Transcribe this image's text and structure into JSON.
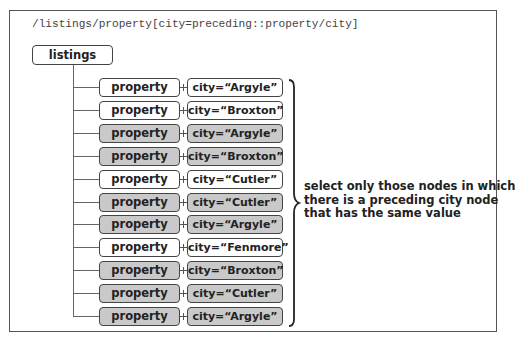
{
  "expression": "/listings/property[city=preceding::property/city]",
  "root": {
    "label": "listings"
  },
  "rows": [
    {
      "element": "property",
      "attribute": "city=“Argyle”",
      "selected": false
    },
    {
      "element": "property",
      "attribute": "city=“Broxton”",
      "selected": false
    },
    {
      "element": "property",
      "attribute": "city=“Argyle”",
      "selected": true
    },
    {
      "element": "property",
      "attribute": "city=“Broxton”",
      "selected": true
    },
    {
      "element": "property",
      "attribute": "city=“Cutler”",
      "selected": false
    },
    {
      "element": "property",
      "attribute": "city=“Cutler”",
      "selected": true
    },
    {
      "element": "property",
      "attribute": "city=“Argyle”",
      "selected": true
    },
    {
      "element": "property",
      "attribute": "city=“Fenmore”",
      "selected": false
    },
    {
      "element": "property",
      "attribute": "city=“Broxton”",
      "selected": true
    },
    {
      "element": "property",
      "attribute": "city=“Cutler”",
      "selected": true
    },
    {
      "element": "property",
      "attribute": "city=“Argyle”",
      "selected": true
    }
  ],
  "annotation": {
    "lines": [
      "select only those nodes in which",
      "there is a preceding city node",
      "that has the same value"
    ]
  },
  "colors": {
    "selected_fill": "#c9c9c9",
    "unselected_fill": "#ffffff",
    "border": "#444444"
  }
}
